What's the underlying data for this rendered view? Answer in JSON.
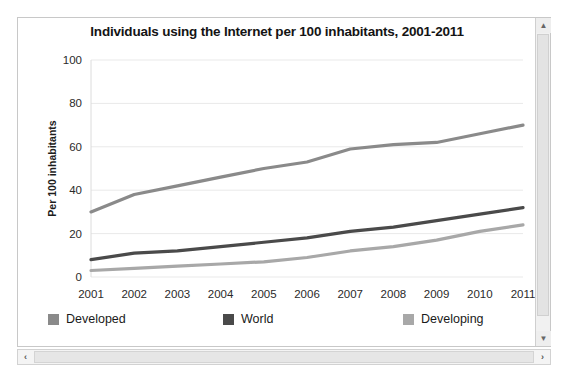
{
  "panel": {
    "vscroll": {
      "up_arrow": "▲",
      "down_arrow": "▼"
    },
    "hscroll": {
      "left_arrow": "‹",
      "right_arrow": "›"
    }
  },
  "chart_data": {
    "type": "line",
    "title": "Individuals using the Internet per 100 inhabitants, 2001-2011",
    "xlabel": "",
    "ylabel": "Per 100 inhabitants",
    "categories": [
      "2001",
      "2002",
      "2003",
      "2004",
      "2005",
      "2006",
      "2007",
      "2008",
      "2009",
      "2010",
      "2011"
    ],
    "yticks": [
      0,
      20,
      40,
      60,
      80,
      100
    ],
    "ylim": [
      0,
      100
    ],
    "grid": true,
    "legend_position": "bottom",
    "series": [
      {
        "name": "Developed",
        "color": "#8a8a8a",
        "values": [
          30,
          38,
          42,
          46,
          50,
          53,
          59,
          61,
          62,
          66,
          70
        ]
      },
      {
        "name": "World",
        "color": "#4a4a4a",
        "values": [
          8,
          11,
          12,
          14,
          16,
          18,
          21,
          23,
          26,
          29,
          32
        ]
      },
      {
        "name": "Developing",
        "color": "#a8a8a8",
        "values": [
          3,
          4,
          5,
          6,
          7,
          9,
          12,
          14,
          17,
          21,
          24
        ]
      }
    ]
  }
}
